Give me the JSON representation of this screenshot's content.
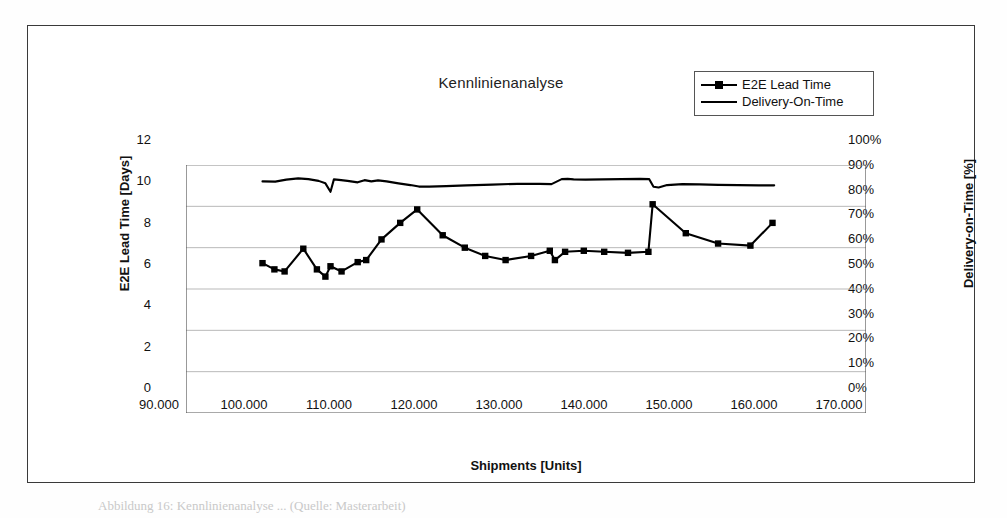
{
  "figure": {
    "caption": "Abbildung 16: Kennlinienanalyse ... (Quelle: Masterarbeit)"
  },
  "chart_data": {
    "type": "line",
    "title": "Kennlinienanalyse",
    "xlabel": "Shipments [Units]",
    "ylabel": "E2E Lead Time [Days]",
    "y2label": "Delivery-on-Time [%]",
    "xlim": [
      90000,
      170000
    ],
    "ylim": [
      0,
      12
    ],
    "y2lim": [
      0,
      1
    ],
    "grid": true,
    "legend_position": "top-right",
    "xticks": [
      "90.000",
      "100.000",
      "110.000",
      "120.000",
      "130.000",
      "140.000",
      "150.000",
      "160.000",
      "170.000"
    ],
    "xtick_values": [
      90000,
      100000,
      110000,
      120000,
      130000,
      140000,
      150000,
      160000,
      170000
    ],
    "yticks": [
      "0",
      "2",
      "4",
      "6",
      "8",
      "10",
      "12"
    ],
    "ytick_values": [
      0,
      2,
      4,
      6,
      8,
      10,
      12
    ],
    "y2ticks": [
      "0%",
      "10%",
      "20%",
      "30%",
      "40%",
      "50%",
      "60%",
      "70%",
      "80%",
      "90%",
      "100%"
    ],
    "y2tick_values": [
      0,
      10,
      20,
      30,
      40,
      50,
      60,
      70,
      80,
      90,
      100
    ],
    "series": [
      {
        "name": "E2E Lead Time",
        "axis": "left",
        "marker": "square",
        "x": [
          99000,
          100400,
          101600,
          103800,
          105400,
          106400,
          107000,
          108300,
          110200,
          111200,
          113000,
          115200,
          117200,
          120200,
          122800,
          125200,
          127600,
          130600,
          132800,
          133400,
          134600,
          136800,
          139200,
          142000,
          144400,
          144900,
          148800,
          152600,
          156400,
          159000
        ],
        "y": [
          7.25,
          6.95,
          6.85,
          7.95,
          6.95,
          6.6,
          7.1,
          6.85,
          7.3,
          7.4,
          8.4,
          9.2,
          9.85,
          8.6,
          8.0,
          7.6,
          7.4,
          7.6,
          7.85,
          7.4,
          7.8,
          7.85,
          7.8,
          7.75,
          7.8,
          10.1,
          8.7,
          8.2,
          8.1,
          9.2
        ]
      },
      {
        "name": "Delivery-On-Time",
        "axis": "right",
        "marker": "none",
        "x": [
          99000,
          100500,
          101800,
          103200,
          104400,
          105600,
          106400,
          107000,
          107400,
          108000,
          109000,
          110200,
          111000,
          111800,
          112600,
          113600,
          115000,
          116400,
          117400,
          118600,
          120600,
          123000,
          126000,
          129000,
          131600,
          133000,
          134200,
          134900,
          135600,
          137000,
          139000,
          141200,
          143400,
          144500,
          145000,
          145600,
          146600,
          148400,
          150400,
          152600,
          155000,
          157400,
          159200
        ],
        "y": [
          93.4,
          93.3,
          94.1,
          94.6,
          94.3,
          93.6,
          92.6,
          89.2,
          94.2,
          94.0,
          93.6,
          93.0,
          93.9,
          93.4,
          93.8,
          93.4,
          92.6,
          91.9,
          91.3,
          91.3,
          91.5,
          91.8,
          92.1,
          92.4,
          92.4,
          92.3,
          94.3,
          94.4,
          94.2,
          94.1,
          94.2,
          94.3,
          94.4,
          94.3,
          91.2,
          90.9,
          91.9,
          92.3,
          92.2,
          92.0,
          91.9,
          91.8,
          91.8
        ]
      }
    ]
  }
}
